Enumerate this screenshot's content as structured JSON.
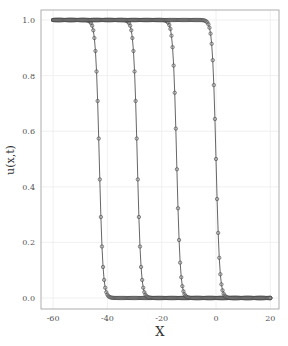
{
  "chart_data": {
    "type": "line",
    "title": "",
    "xlabel": "X",
    "ylabel": "u(x,t)",
    "xlim": [
      -64,
      23.5
    ],
    "ylim": [
      -0.04,
      1.04
    ],
    "xticks": [
      -60,
      -40,
      -20,
      0,
      20
    ],
    "yticks": [
      0.0,
      0.2,
      0.4,
      0.6,
      0.8,
      1.0
    ],
    "xtick_labels": [
      "-60",
      "-40",
      "-20",
      "0",
      "20"
    ],
    "ytick_labels": [
      "0.0",
      "0.2",
      "0.4",
      "0.6",
      "0.8",
      "1.0"
    ],
    "grid": true,
    "legend": null,
    "x_range": [
      -60,
      20
    ],
    "marker_spacing": 0.4,
    "profile": "0.5*(1 - tanh((x - center)/1.35))",
    "series": [
      {
        "name": "t0",
        "center": -43,
        "marker": "circle",
        "line": true
      },
      {
        "name": "t1",
        "center": -29,
        "marker": "circle",
        "line": true
      },
      {
        "name": "t2",
        "center": -14.5,
        "marker": "circle",
        "line": true
      },
      {
        "name": "t3",
        "center": 0,
        "marker": "circle",
        "line": true
      }
    ],
    "sample_points": {
      "x_at_u_0.5": [
        -43,
        -29,
        -14.5,
        0
      ],
      "u_left": 1.0,
      "u_right": 0.0
    }
  }
}
